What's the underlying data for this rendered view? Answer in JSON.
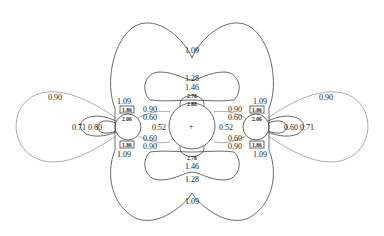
{
  "figure": {
    "title_cropped": "",
    "center_marker": "+"
  },
  "labels": {
    "top_outer": "1.09",
    "top_128": "1.28",
    "top_146": "1.46",
    "top_278": "2.78",
    "top_288": "2.88",
    "bottom_outer": "1.09",
    "bottom_128": "1.28",
    "bottom_146": "1.46",
    "bottom_278": "2.78",
    "center_left": "0.52",
    "center_right": "0.52",
    "left_090_outer": "0.90",
    "left_071": "0.71",
    "left_060": "0.60",
    "left_109_top": "1.09",
    "left_109_bottom": "1.09",
    "left_186_top": "1.86",
    "left_206": "2.06",
    "left_186_bottom": "1.86",
    "left_inner_090_top": "0.90",
    "left_inner_060_top": "0.60",
    "left_inner_060_bottom": "0.60",
    "left_inner_090_bottom": "0.90",
    "right_090_outer": "0.90",
    "right_071": "0.71",
    "right_060": "0.60",
    "right_109_top": "1.09",
    "right_109_bottom": "1.09",
    "right_186_top": "1.86",
    "right_206": "2.06",
    "right_186_bottom": "1.86",
    "right_inner_090_top": "0.90",
    "right_inner_060_top": "0.60",
    "right_inner_060_bottom": "0.60",
    "right_inner_090_bottom": "0.90"
  }
}
